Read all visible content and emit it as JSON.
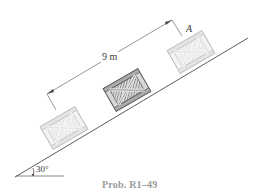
{
  "figure": {
    "caption": "Prob. R1–49",
    "dimension_label": "9 m",
    "point_label": "A",
    "angle_label": "30°",
    "incline_angle_deg": 30,
    "distance_m": 9,
    "crates": [
      {
        "position": "lower",
        "style": "light"
      },
      {
        "position": "middle",
        "style": "dark"
      },
      {
        "position": "upper",
        "style": "light",
        "label": "A"
      }
    ],
    "colors": {
      "line": "#4a4a4a",
      "crate_light_frame": "#c8c8c8",
      "crate_light_fill": "#e6e6e6",
      "crate_dark_frame": "#6a6a6a",
      "crate_dark_fill": "#9a9a9a",
      "caption": "#9a9a9a"
    }
  }
}
